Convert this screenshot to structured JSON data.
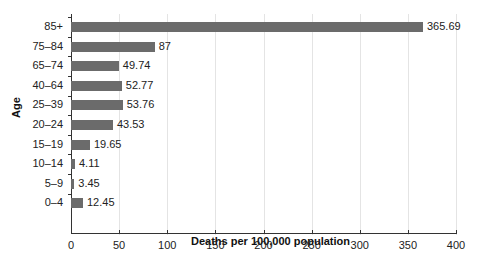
{
  "chart_data": {
    "type": "bar",
    "orientation": "horizontal",
    "title": "",
    "xlabel": "Deaths per 100,000 population",
    "ylabel": "Age",
    "categories": [
      "85+",
      "75–84",
      "65–74",
      "40–64",
      "25–39",
      "20–24",
      "15–19",
      "10–14",
      "5–9",
      "0–4"
    ],
    "values": [
      365.69,
      87,
      49.74,
      52.77,
      53.76,
      43.53,
      19.65,
      4.11,
      3.45,
      12.45
    ],
    "value_labels": [
      "365.69",
      "87",
      "49.74",
      "52.77",
      "53.76",
      "43.53",
      "19.65",
      "4.11",
      "3.45",
      "12.45"
    ],
    "xlim": [
      0,
      400
    ],
    "xticks": [
      "0",
      "50",
      "100",
      "150",
      "200",
      "250",
      "300",
      "350",
      "400"
    ],
    "grid": true,
    "legend": null,
    "bar_color": "#6b6b6b"
  }
}
